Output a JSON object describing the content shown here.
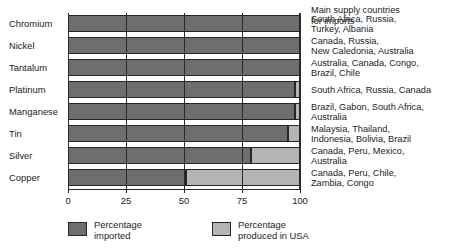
{
  "chart_data": {
    "type": "bar",
    "orientation": "horizontal",
    "stacked": true,
    "title": "",
    "xlabel": "",
    "ylabel": "",
    "xlim": [
      0,
      100
    ],
    "xticks": [
      "0",
      "25",
      "50",
      "75",
      "100"
    ],
    "xtick_values": [
      0,
      25,
      50,
      75,
      100
    ],
    "grid": true,
    "legend_position": "bottom",
    "categories": [
      "Chromium",
      "Nickel",
      "Tantalum",
      "Platinum",
      "Manganese",
      "Tin",
      "Silver",
      "Copper"
    ],
    "series": [
      {
        "name": "Percentage imported",
        "color": "#6e6e6e",
        "values": [
          100,
          100,
          100,
          98,
          98,
          95,
          79,
          51
        ]
      },
      {
        "name": "Percentage produced in USA",
        "color": "#b4b4b4",
        "values": [
          0,
          0,
          0,
          2,
          2,
          5,
          21,
          49
        ]
      }
    ],
    "annotations_header": "Main supply countries\nfor imports",
    "annotations": [
      "South Africa, Russia,\nTurkey, Albania",
      "Canada, Russia,\nNew Caledonia, Australia",
      "Australia, Canada, Congo,\nBrazil, Chile",
      "South Africa, Russia, Canada",
      "Brazil, Gabon, South Africa,\nAustralia",
      "Malaysia, Thailand,\nIndonesia, Bolivia, Brazil",
      "Canada, Peru, Mexico,\nAustralia",
      "Canada, Peru, Chile,\nZambia, Congo"
    ]
  },
  "annotations_header_lines": [
    "Main supply countries",
    "for imports"
  ],
  "annotation_lines": [
    [
      "South Africa, Russia,",
      "Turkey, Albania"
    ],
    [
      "Canada, Russia,",
      "New Caledonia, Australia"
    ],
    [
      "Australia, Canada, Congo,",
      "Brazil, Chile"
    ],
    [
      "South Africa, Russia, Canada"
    ],
    [
      "Brazil, Gabon, South Africa,",
      "Australia"
    ],
    [
      "Malaysia, Thailand,",
      "Indonesia, Bolivia, Brazil"
    ],
    [
      "Canada, Peru, Mexico,",
      "Australia"
    ],
    [
      "Canada, Peru, Chile,",
      "Zambia, Congo"
    ]
  ],
  "legend": {
    "items": [
      {
        "label_lines": [
          "Percentage",
          "imported"
        ],
        "color": "#6e6e6e"
      },
      {
        "label_lines": [
          "Percentage",
          "produced in USA"
        ],
        "color": "#b4b4b4"
      }
    ]
  },
  "colors": {
    "imported": "#6e6e6e",
    "produced_usa": "#b4b4b4",
    "outline": "#262626",
    "text": "#1c1c1c",
    "background": "#ffffff"
  }
}
